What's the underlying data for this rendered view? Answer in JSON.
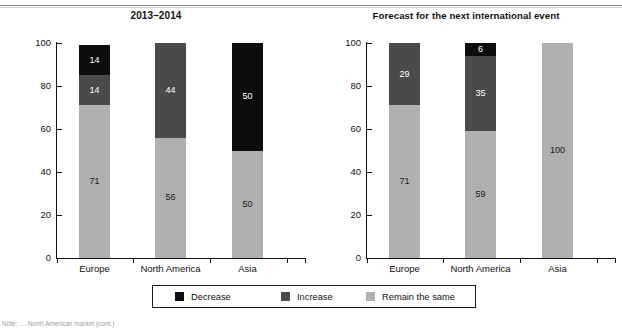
{
  "page": {
    "bottom_note": "Note: … North American market (cont.)"
  },
  "legend": {
    "items": [
      {
        "label": "Decrease",
        "color": "#0d0d0d",
        "key": "decrease"
      },
      {
        "label": "Increase",
        "color": "#4a4a4a",
        "key": "increase"
      },
      {
        "label": "Remain the same",
        "color": "#b0b0b0",
        "key": "remain"
      }
    ]
  },
  "colors": {
    "decrease": "#0d0d0d",
    "increase": "#4a4a4a",
    "remain": "#b0b0b0",
    "axis": "#111111",
    "background": "#ffffff"
  },
  "chart_data": [
    {
      "type": "bar",
      "stacked": true,
      "percent": true,
      "title": "2013–2014",
      "xlabel": "",
      "ylabel": "",
      "ylim": [
        0,
        100
      ],
      "yticks": [
        0,
        20,
        40,
        60,
        80,
        100
      ],
      "grid": false,
      "legend_position": "bottom-center-shared",
      "categories": [
        "Europe",
        "North America",
        "Asia"
      ],
      "series": [
        {
          "name": "Remain the same",
          "color": "#b0b0b0",
          "values": [
            71,
            56,
            50
          ]
        },
        {
          "name": "Increase",
          "color": "#4a4a4a",
          "values": [
            14,
            44,
            0
          ]
        },
        {
          "name": "Decrease",
          "color": "#0d0d0d",
          "values": [
            14,
            0,
            50
          ]
        }
      ]
    },
    {
      "type": "bar",
      "stacked": true,
      "percent": true,
      "title": "Forecast for the next international event",
      "xlabel": "",
      "ylabel": "",
      "ylim": [
        0,
        100
      ],
      "yticks": [
        0,
        20,
        40,
        60,
        80,
        100
      ],
      "grid": false,
      "legend_position": "bottom-center-shared",
      "categories": [
        "Europe",
        "North America",
        "Asia"
      ],
      "series": [
        {
          "name": "Remain the same",
          "color": "#b0b0b0",
          "values": [
            71,
            59,
            100
          ]
        },
        {
          "name": "Increase",
          "color": "#4a4a4a",
          "values": [
            29,
            35,
            0
          ]
        },
        {
          "name": "Decrease",
          "color": "#0d0d0d",
          "values": [
            0,
            6,
            0
          ]
        }
      ]
    }
  ]
}
